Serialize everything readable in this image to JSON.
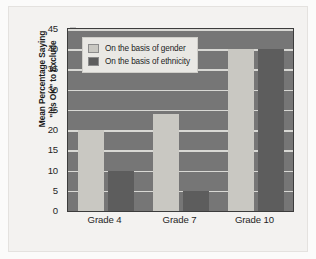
{
  "chart_data": {
    "type": "bar",
    "title": "",
    "xlabel": "",
    "ylabel": "Mean Percentage Saying \"It's OK\" to Exclude",
    "ylabel_lines": [
      "Mean Percentage Saying",
      "\"It's OK\" to Exclude"
    ],
    "categories": [
      "Grade 4",
      "Grade 7",
      "Grade 10"
    ],
    "series": [
      {
        "name": "On the basis of gender",
        "values": [
          20,
          24,
          40
        ],
        "color": "#c9c8c2"
      },
      {
        "name": "On the basis of ethnicity",
        "values": [
          10,
          5,
          40
        ],
        "color": "#5d5d5d"
      }
    ],
    "ylim": [
      0,
      45
    ],
    "ytick_step": 5,
    "yticks": [
      45,
      40,
      35,
      30,
      25,
      20,
      15,
      10,
      5,
      0
    ],
    "grid": true,
    "legend_position": "top-left",
    "plot_background": "#767676",
    "gridline_color": "#d8d8d4",
    "page_background": "#f3f2f0"
  }
}
